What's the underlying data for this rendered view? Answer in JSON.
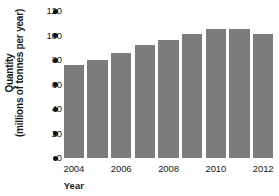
{
  "chart_data": {
    "type": "bar",
    "title": "",
    "xlabel": "Year",
    "ylabel": "Quantity (millions of tonnes per year)",
    "ylabel_lines": [
      "Quantity",
      "(millions of tonnes per year)"
    ],
    "categories": [
      "2004",
      "2005",
      "2006",
      "2007",
      "2008",
      "2009",
      "2010",
      "2011",
      "2012"
    ],
    "values": [
      76,
      80,
      86,
      92,
      96,
      101,
      105,
      105,
      101
    ],
    "ylim": [
      0,
      120
    ],
    "ytick_labels": [
      "0",
      "20",
      "40",
      "60",
      "80",
      "100",
      "120"
    ],
    "ytick_values": [
      0,
      20,
      40,
      60,
      80,
      100,
      120
    ],
    "xtick_labels": [
      "2004",
      "2006",
      "2008",
      "2010",
      "2012"
    ],
    "xtick_categories": [
      "2004",
      "2006",
      "2008",
      "2010",
      "2012"
    ],
    "grid": false,
    "legend": null,
    "legend_position": "none",
    "bar_color": "#7c7c7c",
    "axis_marker_style": "dot",
    "axis_marker_color": "#111111",
    "background_color": "#ffffff"
  }
}
